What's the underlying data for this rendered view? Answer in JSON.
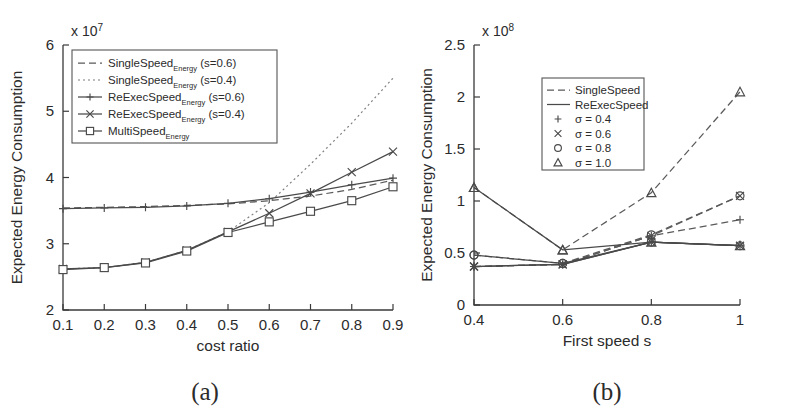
{
  "figure": {
    "panel_a_caption": "(a)",
    "panel_b_caption": "(b)"
  },
  "chart_data": [
    {
      "type": "line",
      "panel": "a",
      "title": "",
      "xlabel": "cost ratio",
      "ylabel": "Expected Energy Consumption",
      "y_exponent_label": "x 10",
      "y_exponent_power": "7",
      "y_scale": 10000000.0,
      "xlim": [
        0.1,
        0.9
      ],
      "ylim": [
        2,
        6
      ],
      "xticks": [
        "0.1",
        "0.2",
        "0.3",
        "0.4",
        "0.5",
        "0.6",
        "0.7",
        "0.8",
        "0.9"
      ],
      "yticks": [
        "2",
        "3",
        "4",
        "5",
        "6"
      ],
      "grid": false,
      "legend_position": "upper-left",
      "x": [
        0.1,
        0.2,
        0.3,
        0.4,
        0.5,
        0.6,
        0.7,
        0.8,
        0.9
      ],
      "series": [
        {
          "name": "SingleSpeed_Energy (s=0.6)",
          "label_main": "SingleSpeed",
          "label_sub": "Energy",
          "label_suffix": "(s=0.6)",
          "style": "dashed",
          "marker": "none",
          "values": [
            3.54,
            3.55,
            3.56,
            3.58,
            3.6,
            3.65,
            3.72,
            3.82,
            3.96
          ]
        },
        {
          "name": "SingleSpeed_Energy (s=0.4)",
          "label_main": "SingleSpeed",
          "label_sub": "Energy",
          "label_suffix": "(s=0.4)",
          "style": "dotted",
          "marker": "none",
          "values": [
            2.62,
            2.64,
            2.72,
            2.9,
            3.18,
            3.62,
            4.2,
            4.82,
            5.5
          ]
        },
        {
          "name": "ReExecSpeed_Energy (s=0.6)",
          "label_main": "ReExecSpeed",
          "label_sub": "Energy",
          "label_suffix": "(s=0.6)",
          "style": "solid",
          "marker": "plus",
          "values": [
            3.53,
            3.54,
            3.55,
            3.57,
            3.61,
            3.68,
            3.78,
            3.89,
            3.99
          ]
        },
        {
          "name": "ReExecSpeed_Energy (s=0.4)",
          "label_main": "ReExecSpeed",
          "label_sub": "Energy",
          "label_suffix": "(s=0.4)",
          "style": "solid",
          "marker": "cross",
          "values": [
            2.62,
            2.64,
            2.72,
            2.9,
            3.18,
            3.46,
            3.76,
            4.08,
            4.39
          ]
        },
        {
          "name": "MultiSpeed_Energy",
          "label_main": "MultiSpeed",
          "label_sub": "Energy",
          "label_suffix": "",
          "style": "solid",
          "marker": "square",
          "values": [
            2.61,
            2.64,
            2.71,
            2.89,
            3.17,
            3.33,
            3.49,
            3.65,
            3.86
          ]
        }
      ]
    },
    {
      "type": "line",
      "panel": "b",
      "title": "",
      "xlabel": "First speed s",
      "ylabel": "Expected Energy Consumption",
      "y_exponent_label": "x 10",
      "y_exponent_power": "8",
      "y_scale": 100000000.0,
      "xlim": [
        0.4,
        1.0
      ],
      "ylim": [
        0,
        2.5
      ],
      "xticks": [
        "0.4",
        "0.6",
        "0.8",
        "1"
      ],
      "yticks": [
        "0",
        "0.5",
        "1",
        "1.5",
        "2",
        "2.5"
      ],
      "grid": false,
      "legend_position": "upper-center",
      "legend_entries": [
        {
          "label": "SingleSpeed",
          "style": "dashed",
          "marker": "none"
        },
        {
          "label": "ReExecSpeed",
          "style": "solid",
          "marker": "none"
        },
        {
          "label": "σ = 0.4",
          "style": "none",
          "marker": "plus"
        },
        {
          "label": "σ = 0.6",
          "style": "none",
          "marker": "cross"
        },
        {
          "label": "σ = 0.8",
          "style": "none",
          "marker": "circle"
        },
        {
          "label": "σ = 1.0",
          "style": "none",
          "marker": "triangle"
        }
      ],
      "x": [
        0.4,
        0.6,
        0.8,
        1.0
      ],
      "series": [
        {
          "name": "SingleSpeed σ = 0.4",
          "algo": "SingleSpeed",
          "style": "dashed",
          "marker": "plus",
          "values": [
            0.37,
            0.39,
            0.665,
            0.82
          ]
        },
        {
          "name": "SingleSpeed σ = 0.6",
          "algo": "SingleSpeed",
          "style": "dashed",
          "marker": "cross",
          "values": [
            0.37,
            0.39,
            0.665,
            1.05
          ]
        },
        {
          "name": "SingleSpeed σ = 0.8",
          "algo": "SingleSpeed",
          "style": "dashed",
          "marker": "circle",
          "values": [
            0.48,
            0.4,
            0.675,
            1.05
          ]
        },
        {
          "name": "SingleSpeed σ = 1.0",
          "algo": "SingleSpeed",
          "style": "dashed",
          "marker": "triangle",
          "values": [
            1.13,
            0.53,
            1.08,
            2.05
          ]
        },
        {
          "name": "ReExecSpeed σ = 0.4",
          "algo": "ReExecSpeed",
          "style": "solid",
          "marker": "plus",
          "values": [
            0.37,
            0.39,
            0.605,
            0.57
          ]
        },
        {
          "name": "ReExecSpeed σ = 0.6",
          "algo": "ReExecSpeed",
          "style": "solid",
          "marker": "cross",
          "values": [
            0.37,
            0.39,
            0.605,
            0.57
          ]
        },
        {
          "name": "ReExecSpeed σ = 0.8",
          "algo": "ReExecSpeed",
          "style": "solid",
          "marker": "circle",
          "values": [
            0.48,
            0.4,
            0.605,
            0.57
          ]
        },
        {
          "name": "ReExecSpeed σ = 1.0",
          "algo": "ReExecSpeed",
          "style": "solid",
          "marker": "triangle",
          "values": [
            1.13,
            0.53,
            0.605,
            0.57
          ]
        }
      ]
    }
  ]
}
